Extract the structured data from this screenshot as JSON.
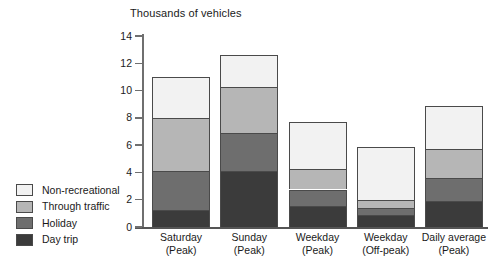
{
  "chart_data": {
    "type": "bar",
    "subtype": "stacked-vertical",
    "title": "Thousands of vehicles",
    "xlabel": "",
    "ylabel": "",
    "ylim": [
      0,
      14
    ],
    "yticks": [
      0,
      2,
      4,
      6,
      8,
      10,
      12,
      14
    ],
    "ytick_labels": [
      "0",
      "2",
      "4",
      "6",
      "8",
      "10",
      "12",
      "14"
    ],
    "grid": false,
    "legend_position": "left-bottom",
    "categories": [
      "Saturday\n(Peak)",
      "Sunday\n(Peak)",
      "Weekday\n(Peak)",
      "Weekday\n(Off-peak)",
      "Daily average\n(Peak)"
    ],
    "category_lines": [
      {
        "line1": "Saturday",
        "line2": "(Peak)"
      },
      {
        "line1": "Sunday",
        "line2": "(Peak)"
      },
      {
        "line1": "Weekday",
        "line2": "(Peak)"
      },
      {
        "line1": "Weekday",
        "line2": "(Off-peak)"
      },
      {
        "line1": "Daily average",
        "line2": "(Peak)"
      }
    ],
    "series": [
      {
        "name": "Day trip",
        "color": "#3b3b3b",
        "values": [
          1.25,
          4.1,
          1.55,
          0.85,
          1.9
        ]
      },
      {
        "name": "Holiday",
        "color": "#6e6e6e",
        "values": [
          2.85,
          2.8,
          1.2,
          0.55,
          1.7
        ]
      },
      {
        "name": "Through traffic",
        "color": "#b6b6b6",
        "values": [
          3.9,
          3.35,
          1.5,
          0.6,
          2.1
        ]
      },
      {
        "name": "Non-recreational",
        "color": "#f2f2f2",
        "values": [
          3.0,
          2.35,
          3.45,
          3.85,
          3.2
        ]
      }
    ],
    "totals": [
      11.0,
      12.6,
      7.7,
      5.85,
      8.9
    ],
    "legend_order_top_to_bottom": [
      "Non-recreational",
      "Through traffic",
      "Holiday",
      "Day trip"
    ]
  },
  "legend": {
    "items": [
      {
        "label": "Non-recreational",
        "color": "#f2f2f2"
      },
      {
        "label": "Through traffic",
        "color": "#b6b6b6"
      },
      {
        "label": "Holiday",
        "color": "#6e6e6e"
      },
      {
        "label": "Day trip",
        "color": "#3b3b3b"
      }
    ]
  },
  "colors": {
    "axis": "#6f6f6f",
    "baseline": "#555555",
    "segment_border": "#4a4a4a",
    "text": "#1a1a1a",
    "background": "#ffffff"
  }
}
